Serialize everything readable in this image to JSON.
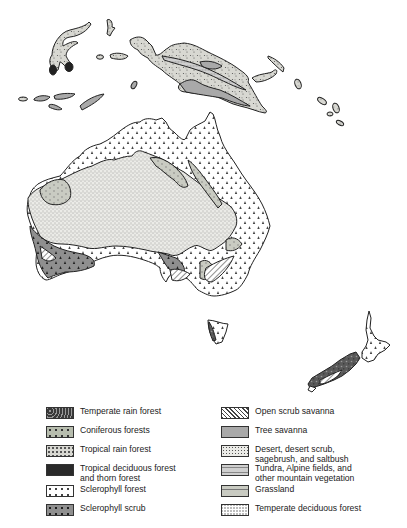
{
  "map": {
    "title": "Vegetation of Australia, New Guinea and New Zealand",
    "regions": [
      "Indonesia islands",
      "New Guinea",
      "Australia",
      "Tasmania",
      "New Zealand"
    ]
  },
  "legend": {
    "left": [
      {
        "label": "Temperate rain forest",
        "pattern": "temperate-rain"
      },
      {
        "label": "Coniferous forests",
        "pattern": "coniferous"
      },
      {
        "label": "Tropical rain forest",
        "pattern": "tropical-rain"
      },
      {
        "label": "Tropical deciduous forest\n  and thorn forest",
        "pattern": "tropical-deciduous"
      },
      {
        "label": "Sclerophyll forest",
        "pattern": "sclerophyll-forest"
      },
      {
        "label": "Sclerophyll scrub",
        "pattern": "sclerophyll-scrub"
      }
    ],
    "right": [
      {
        "label": "Open scrub savanna",
        "pattern": "open-scrub"
      },
      {
        "label": "Tree savanna",
        "pattern": "tree-savanna"
      },
      {
        "label": "Desert, desert scrub,\n  sagebrush, and saltbush",
        "pattern": "desert"
      },
      {
        "label": "Tundra, Alpine fields, and\n  other mountain vegetation",
        "pattern": "tundra"
      },
      {
        "label": "Grassland",
        "pattern": "grassland"
      },
      {
        "label": "Temperate deciduous forest",
        "pattern": "temperate-deciduous"
      }
    ]
  },
  "caption": {
    "text": "...after ... E. Eyre ... 1950. Each ..."
  },
  "colors": {
    "outline": "#222222",
    "tree_savanna": "#a9a9a9",
    "grassland": "#cfd0c8",
    "desert_bg": "#e6e6e2",
    "background": "#ffffff"
  }
}
